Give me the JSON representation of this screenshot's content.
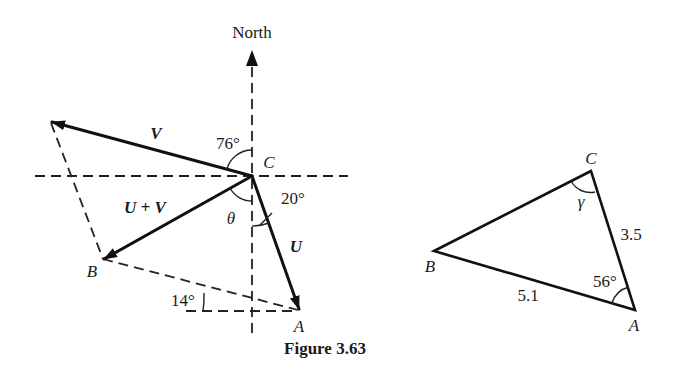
{
  "figure": {
    "caption": "Figure 3.63",
    "left_diagram": {
      "direction_label": "North",
      "vectors": {
        "u": "U",
        "v": "V",
        "sum": "U + V"
      },
      "points": {
        "a": "A",
        "b": "B",
        "c": "C"
      },
      "angles": {
        "v_from_north": "76°",
        "u_from_south": "20°",
        "theta": "θ",
        "ab_from_horizontal": "14°"
      }
    },
    "right_diagram": {
      "points": {
        "a": "A",
        "b": "B",
        "c": "C"
      },
      "sides": {
        "ca": "3.5",
        "ab": "5.1"
      },
      "angles": {
        "a": "56°",
        "c": "γ"
      }
    }
  }
}
